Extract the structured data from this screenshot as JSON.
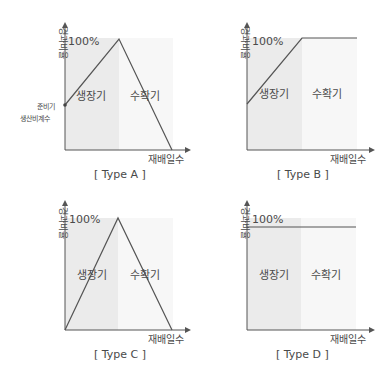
{
  "colors": {
    "growth_fill": "#ebebeb",
    "harvest_fill": "#f7f7f7",
    "line": "#555555",
    "axis": "#555555",
    "text": "#4a4a4a"
  },
  "common": {
    "y_axis_label": "경과비율",
    "x_axis_label": "재배일수",
    "max_label": "100%",
    "growth_label": "생장기",
    "harvest_label": "수확기"
  },
  "panels": [
    {
      "id": "A",
      "caption": "[ Type A ]",
      "extra_label_line1": "준비기",
      "extra_label_line2": "생산비계수",
      "shape": "starts at preparation-period coefficient, rises to 100% at end of growth period, falls to 0 at end of harvest period"
    },
    {
      "id": "B",
      "caption": "[ Type B ]",
      "shape": "starts above 0, rises to 100% at end of growth period, stays at 100% through harvest period"
    },
    {
      "id": "C",
      "caption": "[ Type C ]",
      "shape": "starts at 0, rises to 100% at end of growth period, falls to 0 at end of harvest period"
    },
    {
      "id": "D",
      "caption": "[ Type D ]",
      "shape": "constant at ~100% across growth and harvest periods"
    }
  ]
}
